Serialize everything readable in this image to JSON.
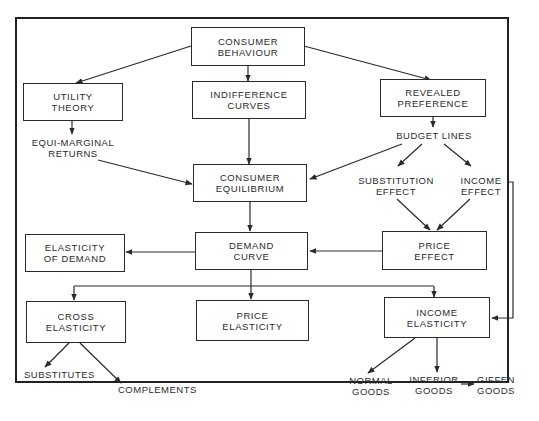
{
  "diagram": {
    "boxes": {
      "consumer_behaviour": "CONSUMER\nBEHAVIOUR",
      "utility_theory": "UTILITY\nTHEORY",
      "indifference_curves": "INDIFFERENCE\nCURVES",
      "revealed_preference": "REVEALED\nPREFERENCE",
      "consumer_equilibrium": "CONSUMER\nEQUILIBRIUM",
      "elasticity_of_demand": "ELASTICITY\nOF DEMAND",
      "demand_curve": "DEMAND\nCURVE",
      "price_effect": "PRICE\nEFFECT",
      "cross_elasticity": "CROSS\nELASTICITY",
      "price_elasticity": "PRICE\nELASTICITY",
      "income_elasticity": "INCOME\nELASTICITY"
    },
    "labels": {
      "equi_marginal_returns": "EQUI-MARGINAL\nRETURNS",
      "budget_lines": "BUDGET LINES",
      "substitution_effect": "SUBSTITUTION\nEFFECT",
      "income_effect": "INCOME\nEFFECT",
      "substitutes": "SUBSTITUTES",
      "complements": "COMPLEMENTS",
      "normal_goods": "NORMAL\nGOODS",
      "inferior_goods": "INFERIOR\nGOODS",
      "giffen_goods": "GIFFEN\nGOODS"
    },
    "edges": [
      [
        "Consumer Behaviour",
        "Utility Theory"
      ],
      [
        "Consumer Behaviour",
        "Indifference Curves"
      ],
      [
        "Consumer Behaviour",
        "Revealed Preference"
      ],
      [
        "Utility Theory",
        "Equi-Marginal Returns"
      ],
      [
        "Equi-Marginal Returns",
        "Consumer Equilibrium"
      ],
      [
        "Indifference Curves",
        "Consumer Equilibrium"
      ],
      [
        "Revealed Preference",
        "Budget Lines"
      ],
      [
        "Budget Lines",
        "Consumer Equilibrium"
      ],
      [
        "Budget Lines",
        "Substitution Effect"
      ],
      [
        "Budget Lines",
        "Income Effect"
      ],
      [
        "Substitution Effect",
        "Price Effect"
      ],
      [
        "Income Effect",
        "Price Effect"
      ],
      [
        "Income Effect",
        "Income Elasticity"
      ],
      [
        "Consumer Equilibrium",
        "Demand Curve"
      ],
      [
        "Price Effect",
        "Demand Curve"
      ],
      [
        "Demand Curve",
        "Elasticity of Demand"
      ],
      [
        "Demand Curve",
        "Cross Elasticity"
      ],
      [
        "Demand Curve",
        "Price Elasticity"
      ],
      [
        "Demand Curve",
        "Income Elasticity"
      ],
      [
        "Cross Elasticity",
        "Substitutes"
      ],
      [
        "Cross Elasticity",
        "Complements"
      ],
      [
        "Income Elasticity",
        "Normal Goods"
      ],
      [
        "Income Elasticity",
        "Inferior Goods"
      ],
      [
        "Inferior Goods",
        "Giffen Goods"
      ]
    ]
  }
}
